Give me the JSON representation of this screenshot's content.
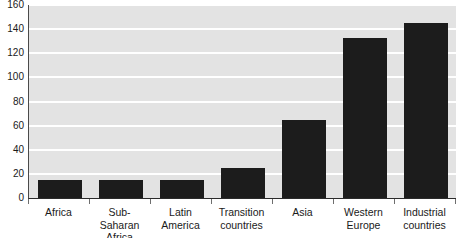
{
  "chart_data": {
    "type": "bar",
    "title": "",
    "subtitle": "",
    "xlabel": "",
    "ylabel": "",
    "categories": [
      "Africa",
      "Sub-Saharan\nAfrica",
      "Latin\nAmerica",
      "Transition\ncountries",
      "Asia",
      "Western\nEurope",
      "Industrial\ncountries"
    ],
    "values": [
      15,
      15,
      15,
      25,
      65,
      133,
      145
    ],
    "ylim": [
      0,
      160
    ],
    "ytick_labels": [
      "0",
      "20",
      "40",
      "60",
      "80",
      "100",
      "120",
      "140",
      "160"
    ],
    "ytick_values": [
      0,
      20,
      40,
      60,
      80,
      100,
      120,
      140,
      160
    ],
    "grid": true,
    "grid_axis": "y",
    "legend": false,
    "legend_position": "none",
    "annotations": []
  },
  "style": {
    "bar_color": "#1c1c1c",
    "plot_background": "#e3e3e3",
    "gridline_color": "#ffffff",
    "axis_color": "#2b2b2b",
    "text_color": "#1a1a1a",
    "page_background": "#ffffff"
  }
}
